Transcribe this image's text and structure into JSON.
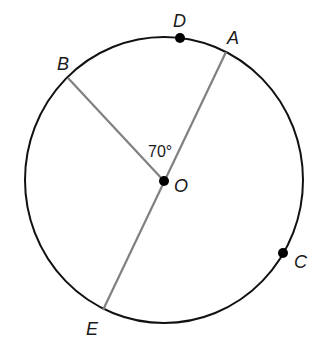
{
  "diagram": {
    "type": "circle-geometry",
    "center": {
      "name": "O",
      "x": 164,
      "y": 181
    },
    "circle": {
      "cx": 164,
      "cy": 180,
      "rx": 139,
      "ry": 143,
      "stroke": "#111111"
    },
    "segment_color": "#808080",
    "points": [
      {
        "name": "D",
        "x": 180,
        "y": 38,
        "dot": true,
        "label_x": 173,
        "label_y": 27
      },
      {
        "name": "A",
        "x": 226,
        "y": 52,
        "dot": false,
        "label_x": 227,
        "label_y": 44
      },
      {
        "name": "B",
        "x": 68,
        "y": 78,
        "dot": false,
        "label_x": 57,
        "label_y": 70
      },
      {
        "name": "C",
        "x": 283,
        "y": 253,
        "dot": true,
        "label_x": 294,
        "label_y": 268
      },
      {
        "name": "E",
        "x": 103,
        "y": 310,
        "dot": false,
        "label_x": 86,
        "label_y": 335
      },
      {
        "name": "O",
        "x": 164,
        "y": 181,
        "dot": true,
        "label_x": 174,
        "label_y": 192
      }
    ],
    "segments": [
      {
        "from": "O",
        "to": "B"
      },
      {
        "from": "A",
        "to": "E",
        "note": "diameter through O"
      }
    ],
    "angle": {
      "label": "70°",
      "between": [
        "B",
        "A"
      ],
      "vertex": "O",
      "label_x": 148,
      "label_y": 157
    }
  }
}
